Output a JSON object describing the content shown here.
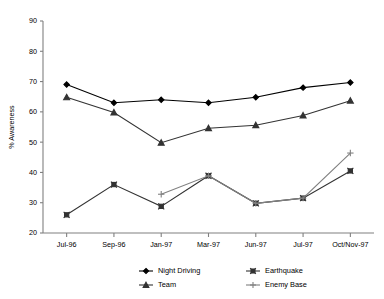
{
  "chart_data": {
    "type": "line",
    "title": "",
    "xlabel": "",
    "ylabel": "% Awareness",
    "categories": [
      "Jul-96",
      "Sep-96",
      "Jan-97",
      "Mar-97",
      "Jun-97",
      "Jul-97",
      "Oct/Nov-97"
    ],
    "ylim": [
      20,
      90
    ],
    "yticks": [
      20,
      30,
      40,
      50,
      60,
      70,
      80,
      90
    ],
    "ytick_labels": [
      "20",
      "30",
      "40",
      "50",
      "60",
      "70",
      "80",
      "90"
    ],
    "grid": false,
    "legend_position": "bottom",
    "series": [
      {
        "name": "Night Driving",
        "marker": "diamond",
        "color": "#000000",
        "values": [
          69.0,
          63.0,
          64.0,
          63.0,
          64.8,
          68.0,
          69.7
        ]
      },
      {
        "name": "Earthquake",
        "marker": "square",
        "color": "#333333",
        "values": [
          26.0,
          36.0,
          28.8,
          38.9,
          29.8,
          31.5,
          40.5
        ]
      },
      {
        "name": "Team",
        "marker": "triangle",
        "color": "#333333",
        "values": [
          64.8,
          59.8,
          49.8,
          54.6,
          55.6,
          58.8,
          63.7
        ]
      },
      {
        "name": "Enemy Base",
        "marker": "plus",
        "color": "#808080",
        "values": [
          null,
          null,
          32.8,
          38.9,
          29.8,
          31.5,
          46.4
        ]
      }
    ]
  },
  "legend": {
    "entries": [
      {
        "label": "Night Driving"
      },
      {
        "label": "Earthquake"
      },
      {
        "label": "Team"
      },
      {
        "label": "Enemy Base"
      }
    ]
  },
  "colors": {
    "axis": "#808080",
    "text": "#000000",
    "series_dark": "#000000",
    "series_mid": "#333333",
    "series_light": "#808080",
    "background": "#ffffff"
  }
}
